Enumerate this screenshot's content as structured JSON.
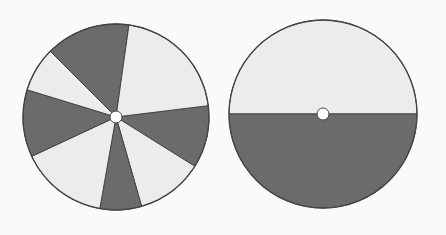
{
  "figure": {
    "colors": {
      "background": "#fafafa",
      "dark": "#6b6b6b",
      "light": "#ececec",
      "outline": "#444444",
      "hole": "#ffffff"
    },
    "disks": [
      {
        "id": "left-disk",
        "cx": 116,
        "cy": 117,
        "r": 93,
        "hole_r": 6,
        "type": "sectors",
        "boundaries_deg": [
          -7,
          32,
          74,
          100,
          155,
          197,
          225,
          278
        ],
        "first_sector_shade": "dark"
      },
      {
        "id": "right-disk",
        "cx": 323,
        "cy": 114,
        "r": 94,
        "hole_r": 6,
        "type": "halves",
        "top_shade": "light",
        "bottom_shade": "dark"
      }
    ]
  }
}
